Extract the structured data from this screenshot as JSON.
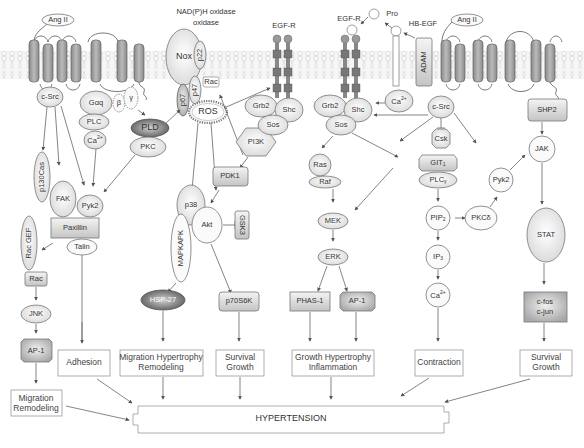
{
  "receptors": {
    "ang2_left": "Ang II",
    "ang2_right": "Ang II",
    "nadph_oxidase": "NAD(P)H oxidase",
    "egfr_1": "EGF-R",
    "egfr_2": "EGF-R",
    "pro": "Pro",
    "hb_egf": "HB-EGF",
    "adam": "ADAM"
  },
  "nodes": {
    "c_src_left": "c-Src",
    "g_alpha_q": "Gαq",
    "beta": "β",
    "gamma": "γ",
    "plc": "PLC",
    "ca_left": "Ca2+",
    "pld": "PLD",
    "pkc": "PKC",
    "nox": "Nox",
    "p22": "p22",
    "p47": "p47",
    "p67": "p67",
    "rac_top": "Rac",
    "ros": "ROS",
    "grb2_1": "Grb2",
    "shc_1": "Shc",
    "sos_1": "Sos",
    "grb2_2": "Grb2",
    "shc_2": "Shc",
    "sos_2": "Sos",
    "ca_right": "Ca2+",
    "c_src_right": "c-Src",
    "csk": "Csk",
    "shp2": "SHP2",
    "jak": "JAK",
    "p130cas": "p130Cas",
    "fak": "FAK",
    "pyk2_left": "Pyk2",
    "paxillin": "Paxillin",
    "talin": "Talin",
    "rac_gef": "Rac GEF",
    "rac_left": "Rac",
    "jnk": "JNK",
    "ap1_left": "AP-1",
    "pi3k": "PI3K",
    "pdk1": "PDK1",
    "p38": "p38",
    "mapkapk": "MAPKAPK",
    "akt": "Akt",
    "gsk3": "GSK3",
    "hsp27": "HSP-27",
    "p70s6k": "p70S6K",
    "ras": "Ras",
    "raf": "Raf",
    "mek": "MEK",
    "erk": "ERK",
    "phas1": "PHAS-1",
    "ap1_right": "AP-1",
    "git1": "GIT1",
    "plc_gamma": "PLCγ",
    "pip2": "PIP2",
    "pkc_delta": "PKCδ",
    "pyk2_right": "Pyk2",
    "ip3": "IP3",
    "ca_bottom": "Ca2+",
    "stat": "STAT",
    "c_fos": "c-fos",
    "c_jun": "c-jun"
  },
  "outcomes": {
    "migration_remodeling": [
      "Migration",
      "Remodeling"
    ],
    "adhesion": "Adhesion",
    "migration_hypertrophy": [
      "Migration Hypertrophy",
      "Remodeling"
    ],
    "survival_growth_1": [
      "Survival",
      "Growth"
    ],
    "growth_hypertrophy": [
      "Growth Hypertrophy",
      "Inflammation"
    ],
    "contraction": "Contraction",
    "survival_growth_2": [
      "Survival",
      "Growth"
    ]
  },
  "final": "HYPERTENSION"
}
